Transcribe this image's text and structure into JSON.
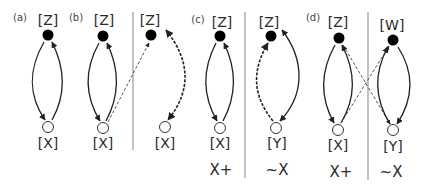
{
  "figure": {
    "panel_tags": [
      {
        "id": "a",
        "text": "(a)",
        "x": 20,
        "y": 18
      },
      {
        "id": "b",
        "text": "(b)",
        "x": 76,
        "y": 18
      },
      {
        "id": "c",
        "text": "(c)",
        "x": 198,
        "y": 20
      },
      {
        "id": "d",
        "text": "(d)",
        "x": 313,
        "y": 18
      }
    ],
    "node_labels": [
      {
        "id": "a-z",
        "text": "[Z]",
        "x": 48,
        "y": 20
      },
      {
        "id": "a-x",
        "text": "[X]",
        "x": 48,
        "y": 143
      },
      {
        "id": "b-z",
        "text": "[Z]",
        "x": 104,
        "y": 20
      },
      {
        "id": "b-x",
        "text": "[X]",
        "x": 103,
        "y": 143
      },
      {
        "id": "b2-z",
        "text": "[Z]",
        "x": 150,
        "y": 20
      },
      {
        "id": "b2-x",
        "text": "[X]",
        "x": 165,
        "y": 143
      },
      {
        "id": "c-z",
        "text": "[Z]",
        "x": 222,
        "y": 22
      },
      {
        "id": "c-x",
        "text": "[X]",
        "x": 220,
        "y": 143
      },
      {
        "id": "c2-z",
        "text": "[Z]",
        "x": 269,
        "y": 22
      },
      {
        "id": "c2-y",
        "text": "[Y]",
        "x": 277,
        "y": 143
      },
      {
        "id": "d-z",
        "text": "[Z]",
        "x": 338,
        "y": 22
      },
      {
        "id": "d-x",
        "text": "[X]",
        "x": 338,
        "y": 145
      },
      {
        "id": "d2-w",
        "text": "[W]",
        "x": 392,
        "y": 25
      },
      {
        "id": "d2-y",
        "text": "[Y]",
        "x": 393,
        "y": 146
      }
    ],
    "condition_labels": [
      {
        "id": "c-cond",
        "text": "X+",
        "x": 221,
        "y": 170
      },
      {
        "id": "c2-cond",
        "text": "~X",
        "x": 277,
        "y": 170
      },
      {
        "id": "d-cond",
        "text": "X+",
        "x": 341,
        "y": 172
      },
      {
        "id": "d2-cond",
        "text": "~X",
        "x": 391,
        "y": 172
      }
    ],
    "filled_nodes": [
      {
        "x": 48,
        "y": 35
      },
      {
        "x": 103,
        "y": 36
      },
      {
        "x": 151,
        "y": 35
      },
      {
        "x": 220,
        "y": 36
      },
      {
        "x": 271,
        "y": 36
      },
      {
        "x": 339,
        "y": 38
      },
      {
        "x": 393,
        "y": 40
      }
    ],
    "open_nodes": [
      {
        "x": 48,
        "y": 127
      },
      {
        "x": 103,
        "y": 128
      },
      {
        "x": 165,
        "y": 127
      },
      {
        "x": 220,
        "y": 128
      },
      {
        "x": 276,
        "y": 128
      },
      {
        "x": 338,
        "y": 130
      },
      {
        "x": 393,
        "y": 130
      }
    ],
    "dividers": [
      {
        "x": 133,
        "y1": 12,
        "y2": 150
      },
      {
        "x": 245,
        "y1": 12,
        "y2": 178
      },
      {
        "x": 368,
        "y1": 12,
        "y2": 180
      }
    ],
    "edges": [
      {
        "d": "M44,42 C28,70 28,95 45,120",
        "style": "solid",
        "arrow": "end"
      },
      {
        "d": "M52,120 C66,95 66,70 52,42",
        "style": "solid",
        "arrow": "end"
      },
      {
        "d": "M99,43 C84,70 84,95 100,121",
        "style": "solid",
        "arrow": "end"
      },
      {
        "d": "M106,121 C120,95 120,70 107,43",
        "style": "solid",
        "arrow": "end"
      },
      {
        "d": "M108,122 L149,43",
        "style": "dashed-thin",
        "arrow": "end"
      },
      {
        "d": "M166,30 C190,60 192,90 168,120",
        "style": "dashed-bold",
        "arrow": "both"
      },
      {
        "d": "M216,43 C202,70 202,95 217,121",
        "style": "solid",
        "arrow": "end"
      },
      {
        "d": "M223,121 C237,95 237,70 224,43",
        "style": "solid",
        "arrow": "end"
      },
      {
        "d": "M273,121 C252,95 252,70 268,43",
        "style": "dashed-bold",
        "arrow": "end"
      },
      {
        "d": "M282,30 C305,60 305,95 280,121",
        "style": "solid",
        "arrow": "both"
      },
      {
        "d": "M335,45 C320,72 320,98 334,123",
        "style": "solid",
        "arrow": "end"
      },
      {
        "d": "M341,123 C356,98 356,72 342,45",
        "style": "solid",
        "arrow": "end"
      },
      {
        "d": "M343,45 L390,124",
        "style": "dashed-thin",
        "arrow": "end"
      },
      {
        "d": "M341,123 L389,46",
        "style": "dashed-thin",
        "arrow": "end"
      },
      {
        "d": "M390,124 C374,98 374,72 388,47",
        "style": "solid",
        "arrow": "end"
      },
      {
        "d": "M398,47 C414,72 414,98 397,124",
        "style": "solid",
        "arrow": "end"
      }
    ]
  }
}
